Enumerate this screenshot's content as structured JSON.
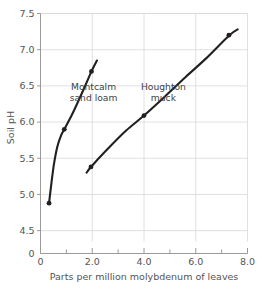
{
  "chart_data": {
    "type": "line",
    "title": "",
    "xlabel": "Parts per million molybdenum of leaves",
    "ylabel": "Soil pH",
    "xlim": [
      0,
      8.0
    ],
    "ylim": [
      4.35,
      7.5
    ],
    "grid": true,
    "legend_position": "inline-annotation",
    "x_ticks": [
      {
        "value": 0,
        "label": "0"
      },
      {
        "value": 2.0,
        "label": "2.0"
      },
      {
        "value": 4.0,
        "label": "4.0"
      },
      {
        "value": 6.0,
        "label": "6.0"
      },
      {
        "value": 8.0,
        "label": "8.0"
      }
    ],
    "x_minor_ticks": [
      1.0,
      3.0,
      5.0,
      7.0
    ],
    "y_ticks": [
      {
        "value": 4.5,
        "label": "4.5"
      },
      {
        "value": 5.0,
        "label": "5.0"
      },
      {
        "value": 5.5,
        "label": "5.5"
      },
      {
        "value": 6.0,
        "label": "6.0"
      },
      {
        "value": 6.5,
        "label": "6.5"
      },
      {
        "value": 7.0,
        "label": "7.0"
      },
      {
        "value": 7.5,
        "label": "7.5"
      }
    ],
    "y_axis_break": true,
    "y_origin_label": "0",
    "series": [
      {
        "name": "Montcalm sand loam",
        "label_line_1": "Montcalm",
        "label_line_2": "sand loam",
        "label_x": 2.05,
        "label_y": 6.45,
        "color": "#231f20",
        "curve": [
          [
            0.33,
            4.88
          ],
          [
            0.42,
            5.15
          ],
          [
            0.52,
            5.42
          ],
          [
            0.65,
            5.66
          ],
          [
            0.8,
            5.82
          ],
          [
            0.92,
            5.9
          ],
          [
            1.2,
            6.09
          ],
          [
            1.5,
            6.32
          ],
          [
            1.75,
            6.52
          ],
          [
            1.97,
            6.7
          ],
          [
            2.18,
            6.85
          ]
        ],
        "points": [
          {
            "x": 0.33,
            "y": 4.88
          },
          {
            "x": 0.92,
            "y": 5.9
          },
          {
            "x": 1.97,
            "y": 6.7
          }
        ]
      },
      {
        "name": "Houghton muck",
        "label_line_1": "Houghton",
        "label_line_2": "muck",
        "label_x": 4.75,
        "label_y": 6.45,
        "color": "#231f20",
        "curve": [
          [
            1.78,
            5.3
          ],
          [
            1.95,
            5.38
          ],
          [
            2.6,
            5.63
          ],
          [
            3.3,
            5.88
          ],
          [
            4.0,
            6.09
          ],
          [
            4.8,
            6.35
          ],
          [
            5.6,
            6.62
          ],
          [
            6.4,
            6.88
          ],
          [
            7.3,
            7.2
          ],
          [
            7.62,
            7.28
          ]
        ],
        "points": [
          {
            "x": 1.95,
            "y": 5.38
          },
          {
            "x": 4.0,
            "y": 6.09
          },
          {
            "x": 7.28,
            "y": 7.2
          }
        ]
      }
    ]
  }
}
